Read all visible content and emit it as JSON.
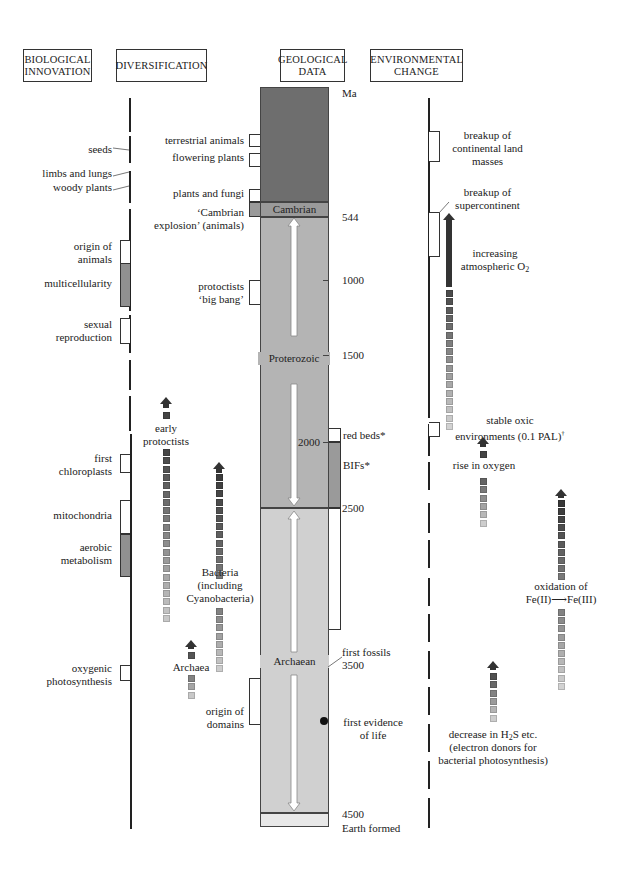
{
  "headers": {
    "biological_innovation": "BIOLOGICAL INNOVATION",
    "diversification": "DIVERSIFICATION",
    "geological_data": "GEOLOGICAL DATA",
    "environmental_change": "ENVIRONMENTAL CHANGE"
  },
  "timescale": {
    "unit": "Ma",
    "ticks": [
      "544",
      "1000",
      "1500",
      "2000",
      "2500",
      "3500",
      "4500"
    ],
    "eons": {
      "cambrian": "Cambrian",
      "proterozoic": "Proterozoic",
      "archaean": "Archaean"
    },
    "earth_formed": "Earth formed",
    "colors": {
      "phanerozoic": "#6e6e6e",
      "cambrian": "#9a9a9a",
      "proterozoic": "#b4b4b4",
      "archaean": "#d0d0d0",
      "hadean": "#e8e8e8"
    }
  },
  "biological_innovation": [
    {
      "label": "seeds"
    },
    {
      "label": "limbs and lungs"
    },
    {
      "label": "woody plants"
    },
    {
      "label": "origin of animals"
    },
    {
      "label": "multicellularity"
    },
    {
      "label": "sexual reproduction"
    },
    {
      "label": "first chloroplasts"
    },
    {
      "label": "mitochondria"
    },
    {
      "label": "aerobic metabolism"
    },
    {
      "label": "oxygenic photosynthesis"
    }
  ],
  "diversification": {
    "brackets": [
      {
        "label": "terrestrial animals"
      },
      {
        "label": "flowering plants"
      },
      {
        "label": "plants and fungi"
      },
      {
        "label": "‘Cambrian explosion’ (animals)"
      },
      {
        "label": "protoctists ‘big bang’"
      },
      {
        "label": "origin of domains"
      }
    ],
    "arrows": [
      {
        "label": "early protoctists"
      },
      {
        "label": "Bacteria (including Cyanobacteria)"
      },
      {
        "label": "Archaea"
      }
    ]
  },
  "geological_data": [
    {
      "label": "red beds*"
    },
    {
      "label": "BIFs*"
    },
    {
      "label": "first fossils"
    },
    {
      "label": "first evidence of life"
    }
  ],
  "environmental_change": [
    {
      "label": "breakup of continental land masses"
    },
    {
      "label": "breakup of supercontinent"
    },
    {
      "label": "increasing atmospheric O2"
    },
    {
      "label": "stable oxic environments (0.1 PAL)†"
    },
    {
      "label": "rise in oxygen"
    },
    {
      "label": "oxidation of Fe(II)→Fe(III)"
    },
    {
      "label": "decrease in H2S etc. (electron donors for bacterial photosynthesis)"
    }
  ],
  "text": {
    "seeds": "seeds",
    "limbs": "limbs and lungs",
    "woody": "woody plants",
    "origin_animals_1": "origin of",
    "origin_animals_2": "animals",
    "multicell": "multicellularity",
    "sexual_1": "sexual",
    "sexual_2": "reproduction",
    "chloro_1": "first",
    "chloro_2": "chloroplasts",
    "mito": "mitochondria",
    "aerobic_1": "aerobic",
    "aerobic_2": "metabolism",
    "oxy_1": "oxygenic",
    "oxy_2": "photosynthesis",
    "terr": "terrestrial animals",
    "flower": "flowering plants",
    "plants_fungi": "plants and fungi",
    "camb_expl_1": "‘Cambrian",
    "camb_expl_2": "explosion’ (animals)",
    "protoc_1": "protoctists",
    "protoc_2": "‘big bang’",
    "early_1": "early",
    "early_2": "protoctists",
    "bact_1": "Bacteria",
    "bact_2": "(including",
    "bact_3": "Cyanobacteria)",
    "archaea": "Archaea",
    "domains_1": "origin of",
    "domains_2": "domains",
    "red_beds": "red beds*",
    "bifs": "BIFs*",
    "first_fossils": "first fossils",
    "first_evid_1": "first evidence",
    "first_evid_2": "of life",
    "breakup_cont_1": "breakup of",
    "breakup_cont_2": "continental land",
    "breakup_cont_3": "masses",
    "breakup_super_1": "breakup of",
    "breakup_super_2": "supercontinent",
    "incr_o2_1": "increasing",
    "incr_o2_2": "atmospheric O",
    "incr_o2_sub": "2",
    "stable_1": "stable oxic",
    "stable_2": "environments (0.1 PAL)",
    "stable_sup": "†",
    "rise_o2": "rise in oxygen",
    "fe_1": "oxidation of",
    "fe_2": "Fe(II)⟶Fe(III)",
    "h2s_1a": "decrease in H",
    "h2s_sub": "2",
    "h2s_1b": "S etc.",
    "h2s_2": "(electron donors for",
    "h2s_3": "bacterial photosynthesis)"
  }
}
